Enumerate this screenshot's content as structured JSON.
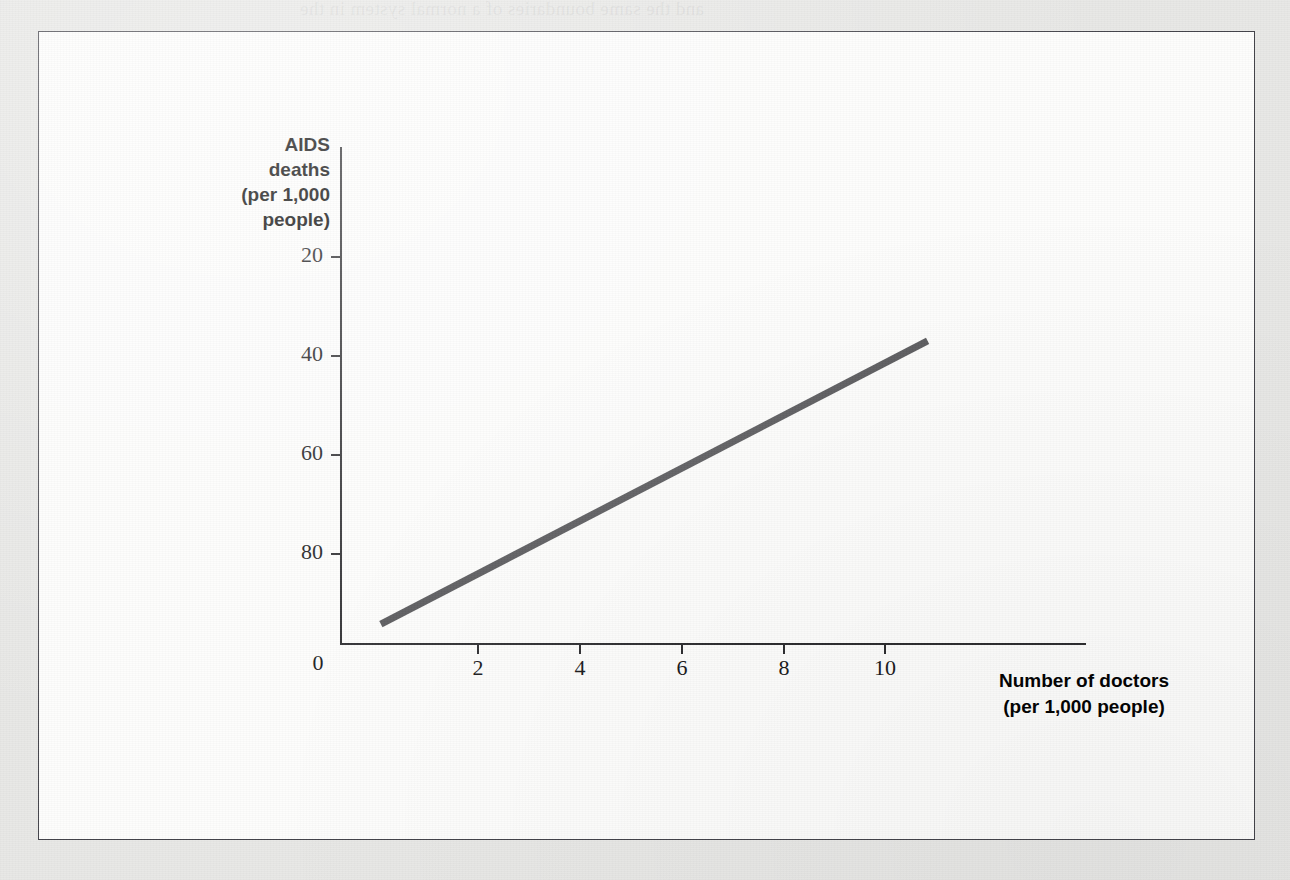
{
  "figure": {
    "border_color": "#43434a",
    "panel_background": "#fdfdfc",
    "page_background": "#e8e8e6"
  },
  "bleed_through": {
    "line_1": "and the same boundaries of a normal system in the",
    "line_2": "that cannot be inferred with high incidence of AIDS deaths than",
    "line_3": "countries with fewer doctors. Does this mean that doctors",
    "line_4": "cause AIDS, or that AIDS causes the population?",
    "line_5": "some of this into"
  },
  "chart_data": {
    "type": "line",
    "title": "",
    "xlabel": "Number of doctors (per 1,000 people)",
    "ylabel": "AIDS deaths (per 1,000 people)",
    "xlabel_lines": [
      "Number of doctors",
      "(per 1,000 people)"
    ],
    "ylabel_lines": [
      "AIDS",
      "deaths",
      "(per 1,000",
      "people)"
    ],
    "xlim": [
      0,
      14.6
    ],
    "ylim": [
      0,
      100
    ],
    "xticks": [
      0,
      2,
      4,
      6,
      8,
      10
    ],
    "xticklabels": [
      "0",
      "2",
      "4",
      "6",
      "8",
      "10"
    ],
    "yticks": [
      20,
      40,
      60,
      80
    ],
    "yticklabels": [
      "20",
      "40",
      "60",
      "80"
    ],
    "grid": false,
    "legend": "none",
    "series": [
      {
        "name": "AIDS deaths vs doctors",
        "color": "#555558",
        "line_width": 7,
        "x": [
          0.8,
          11.5
        ],
        "values": [
          4,
          61
        ]
      }
    ]
  },
  "axis_geometry": {
    "y_axis_x": 301,
    "y_axis_top": 115,
    "y_axis_bottom": 612,
    "x_axis_y": 611,
    "x_axis_left": 301,
    "x_axis_right": 1047,
    "y_tick_pixels": [
      225,
      324,
      423,
      522
    ],
    "x_tick_pixels": [
      439,
      541,
      643,
      745,
      846
    ],
    "origin_label_x": 301
  }
}
